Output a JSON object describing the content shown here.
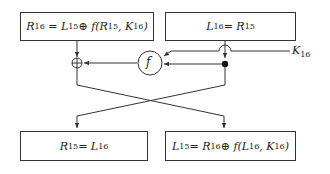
{
  "diagram": {
    "title": "",
    "boxes": {
      "top_left": {
        "lhs": "R",
        "lhs_sub": "16",
        "rhs": "= L",
        "rhs_sub": "15",
        "tail": " ⊕ f(R",
        "tail_sub": "15",
        "tail2": ", K",
        "tail2_sub": "16",
        "tail3": ")"
      },
      "top_right": {
        "lhs": "L",
        "lhs_sub": "16",
        "rhs": " = R",
        "rhs_sub": "15"
      },
      "bottom_left": {
        "lhs": "R",
        "lhs_sub": "15",
        "rhs": " = L",
        "rhs_sub": "16"
      },
      "bottom_right": {
        "lhs": "L",
        "lhs_sub": "15",
        "rhs": " = R",
        "rhs_sub": "16",
        "tail": " ⊕ f(L",
        "tail_sub": "16",
        "tail2": ", K",
        "tail2_sub": "16",
        "tail3": ")"
      }
    },
    "function_node": {
      "label": "f"
    },
    "xor_node": {
      "symbol": "⊕"
    },
    "key_label": {
      "text": "K",
      "sub": "16"
    }
  }
}
